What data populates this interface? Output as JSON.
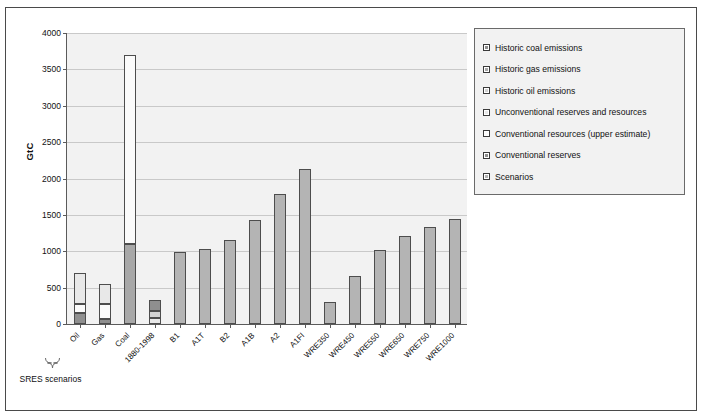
{
  "chart": {
    "ylabel": "GtC",
    "ylim": [
      0,
      4000
    ],
    "ystep": 500,
    "ytick_labels": [
      "4000",
      "3500",
      "3000",
      "2500",
      "2000",
      "1500",
      "1000",
      "500",
      "0"
    ],
    "group_bracket_label": "SRES scenarios",
    "group_bracket_from": "B1",
    "group_bracket_to": "A1FI"
  },
  "legend": {
    "items": [
      {
        "label": "Historic coal emissions",
        "swatch": "legend-swatch-historic-coal",
        "fill": "#8f8f8f"
      },
      {
        "label": "Historic gas emissions",
        "swatch": "legend-swatch-historic-gas",
        "fill": "#a8a8a8"
      },
      {
        "label": "Historic oil emissions",
        "swatch": "legend-swatch-historic-oil",
        "fill": "#d2d2d2"
      },
      {
        "label": "Unconventional reserves and resources",
        "swatch": "legend-swatch-unconventional",
        "fill": "#e8e8e8"
      },
      {
        "label": "Conventional resources (upper estimate)",
        "swatch": "legend-swatch-conventional-resources",
        "fill": "#fbfbfb"
      },
      {
        "label": "Conventional reserves",
        "swatch": "legend-swatch-conventional-reserves",
        "fill": "#8f8f8f"
      },
      {
        "label": "Scenarios",
        "swatch": "legend-swatch-scenarios",
        "fill": "#b4b4b4"
      }
    ]
  },
  "chart_data": {
    "type": "bar",
    "stacked": true,
    "title": "",
    "xlabel": "",
    "ylabel": "GtC",
    "ylim": [
      0,
      4000
    ],
    "ytick_values": [
      0,
      500,
      1000,
      1500,
      2000,
      2500,
      3000,
      3500,
      4000
    ],
    "grid": true,
    "legend_position": "right",
    "categories": [
      "Oil",
      "Gas",
      "Coal",
      "1880-1998",
      "B1",
      "A1T",
      "B2",
      "A1B",
      "A2",
      "A1FI",
      "WRE350",
      "WRE450",
      "WRE550",
      "WRE650",
      "WRE750",
      "WRE1000"
    ],
    "series": [
      {
        "name": "Historic oil emissions",
        "values": [
          null,
          null,
          null,
          85,
          null,
          null,
          null,
          null,
          null,
          null,
          null,
          null,
          null,
          null,
          null,
          null
        ]
      },
      {
        "name": "Historic gas emissions",
        "values": [
          null,
          null,
          null,
          90,
          null,
          null,
          null,
          null,
          null,
          null,
          null,
          null,
          null,
          null,
          null,
          null
        ]
      },
      {
        "name": "Historic coal emissions",
        "values": [
          null,
          null,
          null,
          155,
          null,
          null,
          null,
          null,
          null,
          null,
          null,
          null,
          null,
          null,
          null,
          null
        ]
      },
      {
        "name": "Conventional reserves",
        "values": [
          150,
          75,
          1100,
          null,
          null,
          null,
          null,
          null,
          null,
          null,
          null,
          null,
          null,
          null,
          null,
          null
        ]
      },
      {
        "name": "Unconventional reserves and resources",
        "values": [
          130,
          195,
          null,
          null,
          null,
          null,
          null,
          null,
          null,
          null,
          null,
          null,
          null,
          null,
          null,
          null
        ]
      },
      {
        "name": "Conventional resources (upper estimate)",
        "values": [
          420,
          280,
          2600,
          null,
          null,
          null,
          null,
          null,
          null,
          null,
          null,
          null,
          null,
          null,
          null,
          null
        ]
      },
      {
        "name": "Scenarios",
        "values": [
          null,
          null,
          null,
          null,
          990,
          1030,
          1160,
          1430,
          1790,
          2130,
          300,
          660,
          1020,
          1215,
          1330,
          1440
        ]
      }
    ],
    "totals": [
      700,
      550,
      3700,
      330,
      990,
      1030,
      1160,
      1430,
      1790,
      2130,
      300,
      660,
      1020,
      1215,
      1330,
      1440
    ]
  }
}
